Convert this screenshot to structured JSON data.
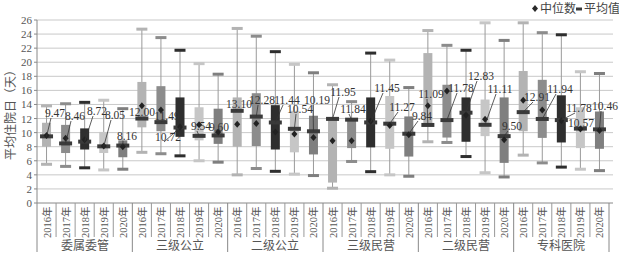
{
  "chart_data": {
    "type": "box",
    "title": "",
    "xlabel": "",
    "ylabel": "平均住院日（天）",
    "ylim": [
      0,
      26
    ],
    "yticks": [
      0,
      2,
      4,
      6,
      8,
      10,
      12,
      14,
      16,
      18,
      20,
      22,
      24,
      26
    ],
    "grid": true,
    "legend": {
      "position": "top-right",
      "entries": [
        {
          "marker": "diamond",
          "label": "中位数"
        },
        {
          "marker": "bar",
          "label": "平均值"
        }
      ]
    },
    "year_colors": {
      "2016年": "#b3b3b3",
      "2017年": "#8c8c8c",
      "2018年": "#2e2e2e",
      "2019年": "#c6c6c6",
      "2020年": "#7f7f7f"
    },
    "groups": [
      {
        "name": "委属委管",
        "boxes": [
          {
            "year": "2016年",
            "whisker_low": 5.5,
            "q1": 8.0,
            "q3": 11.4,
            "whisker_high": 13.8,
            "mean": 9.47,
            "median": 9.6,
            "label": "9.47"
          },
          {
            "year": "2017年",
            "whisker_low": 5.2,
            "q1": 7.1,
            "q3": 11.1,
            "whisker_high": 14.1,
            "mean": 8.46,
            "median": 9.2,
            "label": "8.46"
          },
          {
            "year": "2018年",
            "whisker_low": 5.0,
            "q1": 7.6,
            "q3": 10.6,
            "whisker_high": 14.3,
            "mean": 8.72,
            "median": 9.0,
            "label": "8.72"
          },
          {
            "year": "2019年",
            "whisker_low": 4.7,
            "q1": 7.1,
            "q3": 10.1,
            "whisker_high": 14.6,
            "mean": 8.05,
            "median": 8.1,
            "label": "8.05"
          },
          {
            "year": "2020年",
            "whisker_low": 4.8,
            "q1": 6.5,
            "q3": 8.9,
            "whisker_high": 13.4,
            "mean": 8.16,
            "median": 8.0,
            "label": "8.16"
          }
        ]
      },
      {
        "name": "三级公立",
        "boxes": [
          {
            "year": "2016年",
            "whisker_low": 7.2,
            "q1": 10.75,
            "q3": 17.2,
            "whisker_high": 24.7,
            "mean": 12.0,
            "median": 13.8,
            "label": "12.00"
          },
          {
            "year": "2017年",
            "whisker_low": 7.0,
            "q1": 10.2,
            "q3": 16.6,
            "whisker_high": 23.5,
            "mean": 11.49,
            "median": 13.2,
            "label": "11.49"
          },
          {
            "year": "2018年",
            "whisker_low": 6.7,
            "q1": 9.4,
            "q3": 15.0,
            "whisker_high": 21.7,
            "mean": 10.72,
            "median": 10.8,
            "label": "10.72"
          },
          {
            "year": "2019年",
            "whisker_low": 6.0,
            "q1": 8.9,
            "q3": 13.6,
            "whisker_high": 19.8,
            "mean": 9.54,
            "median": 11.1,
            "label": "9.54"
          },
          {
            "year": "2020年",
            "whisker_low": 5.8,
            "q1": 8.4,
            "q3": 13.4,
            "whisker_high": 18.3,
            "mean": 9.6,
            "median": 10.1,
            "label": "9.60"
          }
        ]
      },
      {
        "name": "二级公立",
        "boxes": [
          {
            "year": "2016年",
            "whisker_low": 4.0,
            "q1": 8.0,
            "q3": 15.0,
            "whisker_high": 24.8,
            "mean": 13.1,
            "median": 11.2,
            "label": "13.10"
          },
          {
            "year": "2017年",
            "whisker_low": 4.9,
            "q1": 8.1,
            "q3": 15.6,
            "whisker_high": 23.7,
            "mean": 12.28,
            "median": 11.3,
            "label": "12.28"
          },
          {
            "year": "2018年",
            "whisker_low": 4.5,
            "q1": 7.6,
            "q3": 13.9,
            "whisker_high": 21.5,
            "mean": 11.44,
            "median": 10.1,
            "label": "11.44"
          },
          {
            "year": "2019年",
            "whisker_low": 4.1,
            "q1": 7.2,
            "q3": 13.1,
            "whisker_high": 19.7,
            "mean": 10.54,
            "median": 9.8,
            "label": "10.54"
          },
          {
            "year": "2020年",
            "whisker_low": 3.9,
            "q1": 6.9,
            "q3": 12.4,
            "whisker_high": 18.5,
            "mean": 10.19,
            "median": 9.3,
            "label": "10.19"
          }
        ]
      },
      {
        "name": "三级民营",
        "boxes": [
          {
            "year": "2016年",
            "whisker_low": 2.1,
            "q1": 2.9,
            "q3": 12.0,
            "whisker_high": 16.8,
            "mean": 11.95,
            "median": 8.85,
            "label": "11.95"
          },
          {
            "year": "2017年",
            "whisker_low": 5.9,
            "q1": 7.8,
            "q3": 11.9,
            "whisker_high": 14.4,
            "mean": 11.84,
            "median": 8.85,
            "label": "11.84"
          },
          {
            "year": "2018年",
            "whisker_low": 4.45,
            "q1": 7.9,
            "q3": 15.0,
            "whisker_high": 21.3,
            "mean": 11.45,
            "median": 11.6,
            "label": "11.45"
          },
          {
            "year": "2019年",
            "whisker_low": 4.0,
            "q1": 7.7,
            "q3": 15.2,
            "whisker_high": 20.3,
            "mean": 11.27,
            "median": 11.0,
            "label": "11.27"
          },
          {
            "year": "2020年",
            "whisker_low": 3.8,
            "q1": 6.6,
            "q3": 12.3,
            "whisker_high": 16.4,
            "mean": 9.84,
            "median": 9.7,
            "label": "9.84"
          }
        ]
      },
      {
        "name": "二级民营",
        "boxes": [
          {
            "year": "2016年",
            "whisker_low": 8.7,
            "q1": 11.0,
            "q3": 21.3,
            "whisker_high": 24.5,
            "mean": 11.09,
            "median": 13.8,
            "label": "11.09"
          },
          {
            "year": "2017年",
            "whisker_low": 8.6,
            "q1": 9.3,
            "q3": 16.8,
            "whisker_high": 22.4,
            "mean": 11.78,
            "median": 15.9,
            "label": "11.78"
          },
          {
            "year": "2018年",
            "whisker_low": 6.6,
            "q1": 8.7,
            "q3": 15.0,
            "whisker_high": 21.7,
            "mean": 12.83,
            "median": 12.5,
            "label": "12.83"
          },
          {
            "year": "2019年",
            "whisker_low": 4.3,
            "q1": 9.5,
            "q3": 14.7,
            "whisker_high": 25.6,
            "mean": 11.11,
            "median": 11.9,
            "label": "11.11"
          },
          {
            "year": "2020年",
            "whisker_low": 3.7,
            "q1": 5.7,
            "q3": 15.0,
            "whisker_high": 23.1,
            "mean": 9.5,
            "median": 9.0,
            "label": "9.50"
          }
        ]
      },
      {
        "name": "专科医院",
        "boxes": [
          {
            "year": "2016年",
            "whisker_low": 6.8,
            "q1": 10.2,
            "q3": 18.75,
            "whisker_high": 25.6,
            "mean": 12.91,
            "median": 14.6,
            "label": "12.91"
          },
          {
            "year": "2017年",
            "whisker_low": 5.7,
            "q1": 9.25,
            "q3": 17.5,
            "whisker_high": 24.2,
            "mean": 11.94,
            "median": 13.2,
            "label": "11.94"
          },
          {
            "year": "2018年",
            "whisker_low": 5.1,
            "q1": 8.6,
            "q3": 15.3,
            "whisker_high": 23.9,
            "mean": 11.78,
            "median": 11.7,
            "label": "11.78"
          },
          {
            "year": "2019年",
            "whisker_low": 4.8,
            "q1": 7.8,
            "q3": 13.6,
            "whisker_high": 18.65,
            "mean": 10.57,
            "median": 10.5,
            "label": "10.57"
          },
          {
            "year": "2020年",
            "whisker_low": 4.6,
            "q1": 7.7,
            "q3": 13.0,
            "whisker_high": 18.4,
            "mean": 10.46,
            "median": 10.3,
            "label": "10.46"
          }
        ]
      }
    ]
  }
}
